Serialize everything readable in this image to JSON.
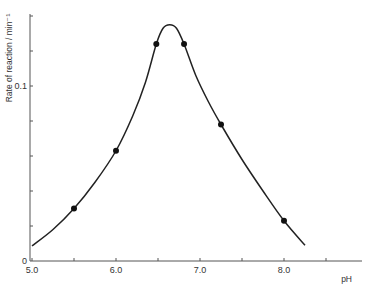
{
  "chart_data": {
    "type": "line",
    "title": "",
    "xlabel": "pH",
    "ylabel": "Rate of reaction / min⁻¹",
    "xlim": [
      5.0,
      8.9
    ],
    "ylim": [
      0,
      0.142
    ],
    "x_ticks": [
      5.0,
      5.5,
      6.0,
      6.5,
      7.0,
      7.5,
      8.0,
      8.5
    ],
    "x_tick_labels": [
      "5.0",
      "",
      "6.0",
      "",
      "7.0",
      "",
      "8.0",
      ""
    ],
    "y_ticks": [
      0,
      0.02,
      0.04,
      0.06,
      0.08,
      0.1,
      0.12,
      0.14
    ],
    "y_tick_labels": [
      "0",
      "",
      "",
      "",
      "",
      "0.1",
      "",
      ""
    ],
    "grid": false,
    "series": [
      {
        "name": "measured",
        "kind": "points",
        "x": [
          5.5,
          6.0,
          6.48,
          6.81,
          7.25,
          8.0
        ],
        "y": [
          0.03,
          0.063,
          0.124,
          0.124,
          0.078,
          0.023
        ]
      },
      {
        "name": "fitted curve",
        "kind": "line",
        "x": [
          5.0,
          5.25,
          5.5,
          5.75,
          6.0,
          6.2,
          6.35,
          6.48,
          6.56,
          6.64,
          6.72,
          6.81,
          6.95,
          7.1,
          7.25,
          7.5,
          7.75,
          8.0,
          8.25
        ],
        "y": [
          0.0086,
          0.018,
          0.03,
          0.045,
          0.063,
          0.083,
          0.102,
          0.124,
          0.133,
          0.135,
          0.133,
          0.124,
          0.106,
          0.091,
          0.078,
          0.058,
          0.04,
          0.023,
          0.009
        ]
      }
    ]
  }
}
